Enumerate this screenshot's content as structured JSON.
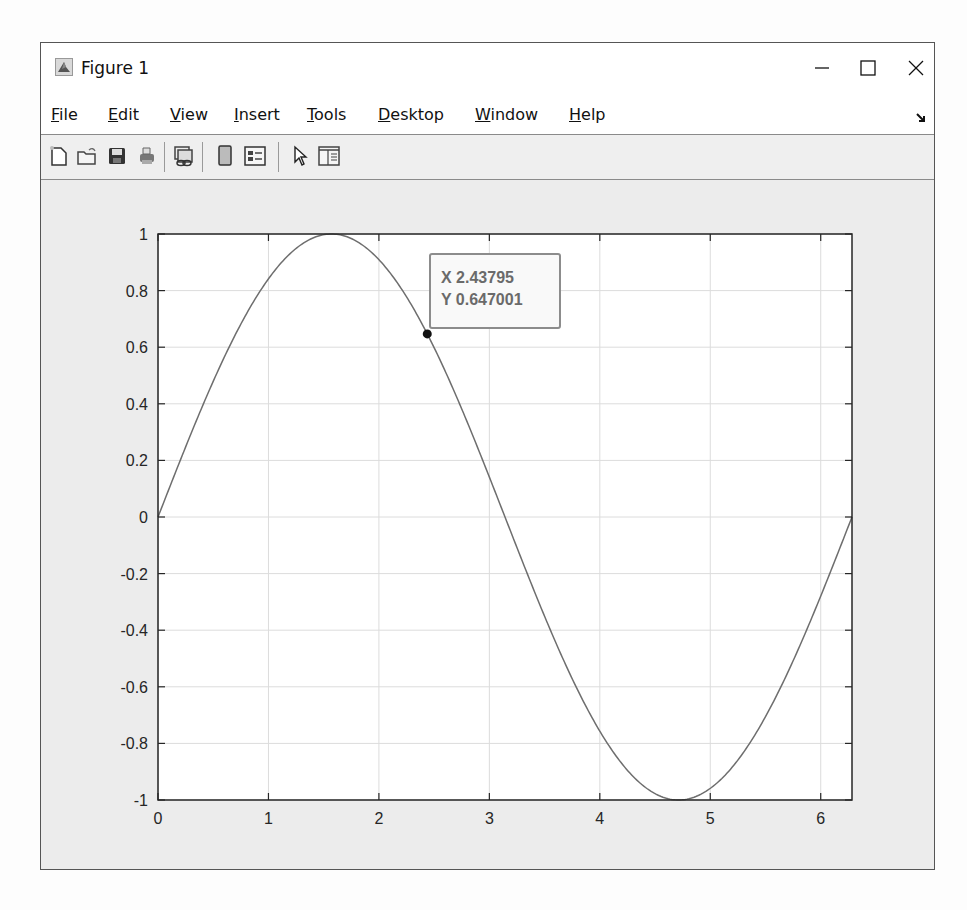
{
  "window": {
    "title": "Figure 1",
    "controls": {
      "minimize": "—",
      "maximize": "☐",
      "close": "✕"
    }
  },
  "menu": {
    "items": [
      {
        "label": "File",
        "accel": "F",
        "rest": "ile"
      },
      {
        "label": "Edit",
        "accel": "E",
        "rest": "dit"
      },
      {
        "label": "View",
        "accel": "V",
        "rest": "iew"
      },
      {
        "label": "Insert",
        "accel": "I",
        "rest": "nsert"
      },
      {
        "label": "Tools",
        "accel": "T",
        "rest": "ools"
      },
      {
        "label": "Desktop",
        "accel": "D",
        "rest": "esktop"
      },
      {
        "label": "Window",
        "accel": "W",
        "rest": "indow"
      },
      {
        "label": "Help",
        "accel": "H",
        "rest": "elp"
      }
    ]
  },
  "toolbar": {
    "buttons": [
      {
        "name": "new-figure",
        "icon": "new-file-icon"
      },
      {
        "name": "open-file",
        "icon": "folder-open-icon"
      },
      {
        "name": "save-figure",
        "icon": "save-icon"
      },
      {
        "name": "print-figure",
        "icon": "print-icon"
      },
      {
        "name": "link-plot",
        "icon": "link-plot-icon"
      },
      {
        "name": "insert-colorbar",
        "icon": "colorbar-icon"
      },
      {
        "name": "insert-legend",
        "icon": "legend-icon"
      },
      {
        "name": "edit-plot",
        "icon": "pointer-icon"
      },
      {
        "name": "open-property-inspector",
        "icon": "property-inspector-icon"
      }
    ]
  },
  "datatip": {
    "x_label": "X 2.43795",
    "y_label": "Y 0.647001",
    "x": 2.43795,
    "y": 0.647001
  },
  "colors": {
    "line": "#6e6e6e",
    "axes": "#262626",
    "grid": "#dcdcdc",
    "plot_bg": "#ffffff",
    "figure_bg": "#ececec"
  },
  "chart_data": {
    "type": "line",
    "title": "",
    "xlabel": "",
    "ylabel": "",
    "function": "y = sin(x)",
    "xlim": [
      0,
      6.2832
    ],
    "ylim": [
      -1,
      1
    ],
    "grid": true,
    "legend": null,
    "x_ticks": [
      0,
      1,
      2,
      3,
      4,
      5,
      6
    ],
    "x_tick_labels": [
      "0",
      "1",
      "2",
      "3",
      "4",
      "5",
      "6"
    ],
    "y_ticks": [
      1,
      0.8,
      0.6,
      0.4,
      0.2,
      0,
      -0.2,
      -0.4,
      -0.6,
      -0.8,
      -1
    ],
    "y_tick_labels": [
      "1",
      "0.8",
      "0.6",
      "0.4",
      "0.2",
      "0",
      "-0.2",
      "-0.4",
      "-0.6",
      "-0.8",
      "-1"
    ],
    "series": [
      {
        "name": "sin(x)",
        "x": [
          0,
          0.5,
          1,
          1.5708,
          2,
          2.5,
          3,
          3.1416,
          3.5,
          4,
          4.5,
          4.7124,
          5,
          5.5,
          6,
          6.2832
        ],
        "y": [
          0,
          0.479,
          0.841,
          1,
          0.909,
          0.598,
          0.141,
          0,
          -0.351,
          -0.757,
          -0.978,
          -1,
          -0.959,
          -0.706,
          -0.279,
          0
        ]
      }
    ],
    "annotations": [
      {
        "type": "datatip",
        "x": 2.43795,
        "y": 0.647001,
        "text": "X 2.43795\nY 0.647001"
      }
    ]
  }
}
